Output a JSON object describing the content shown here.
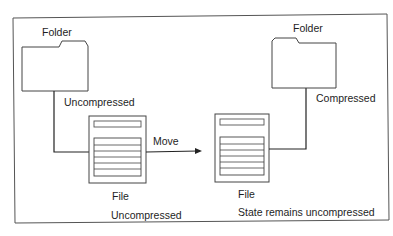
{
  "diagram": {
    "left": {
      "folder_label": "Folder",
      "folder_state": "Uncompressed",
      "file_label": "File",
      "file_state": "Uncompressed"
    },
    "action": {
      "label": "Move"
    },
    "right": {
      "folder_label": "Folder",
      "folder_state": "Compressed",
      "file_label": "File",
      "file_state": "State remains uncompressed"
    },
    "colors": {
      "line": "#3a3a3a",
      "text": "#1e1e1e",
      "background": "#ffffff"
    }
  }
}
